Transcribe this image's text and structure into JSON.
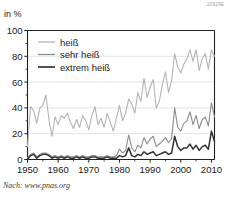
{
  "figure": {
    "code": "20929E",
    "unit_label": "in %",
    "source": "Nach: www.pnas.org"
  },
  "chart_data": {
    "type": "line",
    "title": "",
    "xlabel": "",
    "ylabel": "in %",
    "xlim": [
      1950,
      2011
    ],
    "ylim": [
      0,
      100
    ],
    "yticks": [
      0,
      20,
      40,
      60,
      80,
      100
    ],
    "xticks": [
      1950,
      1960,
      1970,
      1980,
      1990,
      2000,
      2010
    ],
    "xtick_labels": [
      "1950",
      "1960",
      "1970",
      "1980",
      "1990",
      "2000",
      "2010"
    ],
    "ytick_labels": [
      "0",
      "20",
      "40",
      "60",
      "80",
      "100"
    ],
    "grid": "horizontal",
    "legend_position": "top-left",
    "colors": {
      "hot": "#b4b4b4",
      "very_hot": "#8c8c8c",
      "extremely_hot": "#333333"
    },
    "x": [
      1950,
      1951,
      1952,
      1953,
      1954,
      1955,
      1956,
      1957,
      1958,
      1959,
      1960,
      1961,
      1962,
      1963,
      1964,
      1965,
      1966,
      1967,
      1968,
      1969,
      1970,
      1971,
      1972,
      1973,
      1974,
      1975,
      1976,
      1977,
      1978,
      1979,
      1980,
      1981,
      1982,
      1983,
      1984,
      1985,
      1986,
      1987,
      1988,
      1989,
      1990,
      1991,
      1992,
      1993,
      1994,
      1995,
      1996,
      1997,
      1998,
      1999,
      2000,
      2001,
      2002,
      2003,
      2004,
      2005,
      2006,
      2007,
      2008,
      2009,
      2010,
      2011
    ],
    "series": [
      {
        "name": "heiß",
        "label": "heiß",
        "color": "#b4b4b4",
        "values": [
          10,
          41,
          38,
          28,
          40,
          42,
          50,
          31,
          18,
          33,
          27,
          34,
          32,
          36,
          29,
          24,
          31,
          25,
          34,
          30,
          23,
          34,
          41,
          27,
          32,
          25,
          36,
          29,
          22,
          32,
          42,
          30,
          36,
          47,
          43,
          36,
          52,
          45,
          63,
          48,
          56,
          62,
          40,
          45,
          58,
          68,
          52,
          61,
          82,
          72,
          67,
          74,
          78,
          85,
          76,
          85,
          69,
          78,
          82,
          70,
          85,
          80
        ]
      },
      {
        "name": "sehr heiß",
        "label": "sehr heiß",
        "color": "#8c8c8c",
        "values": [
          1,
          4,
          5,
          2,
          4,
          5,
          5,
          4,
          2,
          3,
          2,
          3,
          2,
          3,
          2,
          2,
          3,
          2,
          3,
          2,
          2,
          3,
          3,
          2,
          2,
          2,
          3,
          2,
          2,
          3,
          8,
          5,
          7,
          19,
          9,
          6,
          11,
          9,
          17,
          12,
          16,
          18,
          10,
          12,
          14,
          17,
          13,
          16,
          40,
          25,
          22,
          28,
          30,
          37,
          27,
          34,
          24,
          31,
          33,
          26,
          44,
          33
        ]
      },
      {
        "name": "extrem heiß",
        "label": "extrem heiß",
        "color": "#333333",
        "values": [
          0,
          3,
          4,
          1,
          3,
          4,
          4,
          3,
          1,
          2,
          1,
          2,
          1,
          2,
          1,
          1,
          2,
          1,
          2,
          1,
          1,
          2,
          2,
          1,
          1,
          1,
          2,
          1,
          1,
          1,
          3,
          2,
          3,
          9,
          3,
          2,
          4,
          3,
          6,
          4,
          5,
          6,
          3,
          4,
          5,
          6,
          4,
          5,
          18,
          10,
          7,
          9,
          9,
          12,
          8,
          11,
          7,
          10,
          11,
          8,
          22,
          14
        ]
      }
    ]
  }
}
